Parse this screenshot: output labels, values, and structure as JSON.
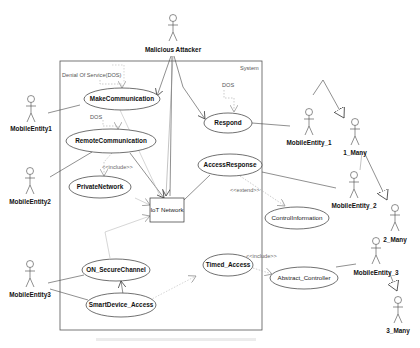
{
  "diagram": {
    "type": "uml-use-case",
    "system_label": "System",
    "notes": {
      "dos_group": "Denial Of Service(DOS)",
      "dos_remote": "DOS",
      "dos_respond": "DOS"
    },
    "stereotypes": {
      "include_private": "<<include>>",
      "extend_control": "<<extend>>",
      "include_abstract": "<<include>>"
    },
    "actors": {
      "malicious_attacker": "Malicious Attacker",
      "mobile_entity1": "MobileEntity1",
      "mobile_entity2": "MobileEntity2",
      "mobile_entity3": "MobileEntity3",
      "mobile_entity_1": "MobileEntity_1",
      "mobile_entity_2": "MobileEntity_2",
      "mobile_entity_3": "MobileEntity_3",
      "one_many": "1_Many",
      "two_many": "2_Many",
      "three_many": "3_Many"
    },
    "use_cases": {
      "make_communication": "MakeCommunication",
      "remote_communication": "RemoteCommunication",
      "private_network": "PrivateNetwork",
      "respond": "Respond",
      "access_response": "AccessResponse",
      "control_information": "ControlInformation",
      "on_secure_channel": "ON_SecureChannel",
      "smart_device_access": "SmartDevice_Access",
      "timed_access": "Timed_Access",
      "abstract_controller": "Abstract_Controller"
    },
    "components": {
      "iot_network": "IoT Network"
    },
    "colors": {
      "line": "#333333",
      "dotted": "#999999",
      "box_border": "#555555"
    }
  }
}
